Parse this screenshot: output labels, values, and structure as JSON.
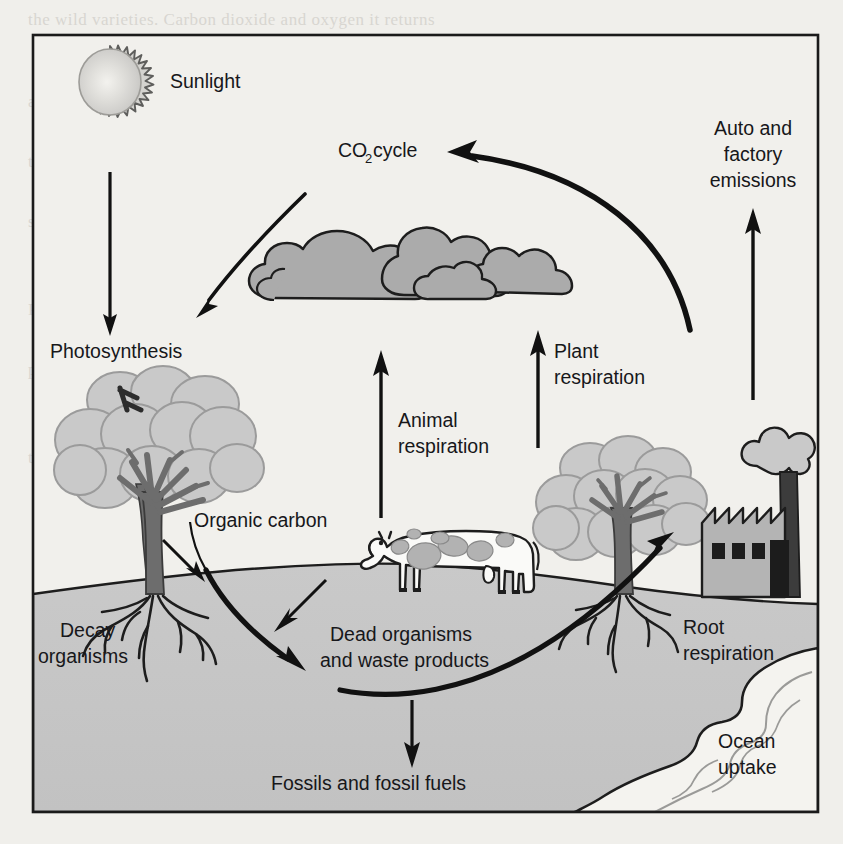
{
  "figure": {
    "border_color": "#1a1a1a",
    "background_color": "#f1f0ec",
    "soil_color": "#c6c6c6",
    "ocean_color": "#f4f3ef",
    "cloud_color": "#ababab",
    "foliage_color": "#c9c9c9",
    "trunk_color": "#6d6d6d",
    "factory_color": "#b4b4b4",
    "arrow_color": "#111111"
  },
  "labels": {
    "sunlight": "Sunlight",
    "co2_cycle_prefix": "CO",
    "co2_cycle_subscript": "2",
    "co2_cycle_suffix": " cycle",
    "auto_factory_line1": "Auto and",
    "auto_factory_line2": "factory",
    "auto_factory_line3": "emissions",
    "photosynthesis": "Photosynthesis",
    "animal_resp_line1": "Animal",
    "animal_resp_line2": "respiration",
    "plant_resp_line1": "Plant",
    "plant_resp_line2": "respiration",
    "organic_carbon": "Organic carbon",
    "decay_line1": "Decay",
    "decay_line2": "organisms",
    "dead_line1": "Dead organisms",
    "dead_line2": "and waste products",
    "root_resp_line1": "Root",
    "root_resp_line2": "respiration",
    "ocean_line1": "Ocean",
    "ocean_line2": "uptake",
    "fossils": "Fossils and fossil fuels"
  },
  "icons": {
    "sun": "sun-icon",
    "cloud": "cloud-icon",
    "tree_left": "tree-icon",
    "tree_right": "tree-icon",
    "cow": "cow-icon",
    "factory": "factory-icon",
    "smoke": "smoke-icon",
    "ocean": "ocean-icon"
  },
  "flows": [
    {
      "name": "sunlight-to-photosynthesis",
      "from": "Sunlight",
      "to": "Photosynthesis",
      "style": "straight-down"
    },
    {
      "name": "co2-to-photosynthesis",
      "from": "CO2 cycle",
      "to": "Photosynthesis",
      "style": "curved-down-left"
    },
    {
      "name": "co2-cycle-arc",
      "from": "Auto and factory emissions",
      "to": "CO2 cycle",
      "style": "arc-left"
    },
    {
      "name": "auto-factory-emissions",
      "from": "Factory",
      "to": "CO2 cycle",
      "style": "straight-up"
    },
    {
      "name": "animal-respiration",
      "from": "Cow",
      "to": "Atmosphere",
      "style": "straight-up"
    },
    {
      "name": "plant-respiration",
      "from": "Tree",
      "to": "Atmosphere",
      "style": "straight-up"
    },
    {
      "name": "tree-to-soil",
      "from": "Tree",
      "to": "Organic carbon",
      "style": "short-down-right"
    },
    {
      "name": "organic-carbon-to-dead",
      "from": "Organic carbon",
      "to": "Dead organisms and waste products",
      "style": "thick-curve"
    },
    {
      "name": "cow-to-dead",
      "from": "Cow",
      "to": "Dead organisms and waste products",
      "style": "short-down-left"
    },
    {
      "name": "dead-to-fossils",
      "from": "Dead organisms and waste products",
      "to": "Fossils and fossil fuels",
      "style": "straight-down"
    },
    {
      "name": "soil-to-root-respiration",
      "from": "Dead organisms and waste products",
      "to": "Root respiration",
      "style": "thick-arc-up-right"
    }
  ],
  "bleed_text": [
    "the wild varieties. Carbon dioxide and oxygen it returns",
    "More CO2 in the wild may be seen as the world of",
    "atmosphere and the other as a change in the seen as",
    "the plants. But in the same atmosphere chemical",
    "the trees are the trees in the case of water and trees",
    "which is a plant as a layer of the surface and a bigger",
    "sum of plants and trees in the forest. And the Tree sun",
    "Oak and grows and changes in the ground and uptake",
    "Plant and Decay ocean — The important nutrients in",
    "to a more of the cycle of organic matter that the",
    "process of the plants and use normal",
    "seen is so that the magnitude greatly takes",
    "the plant. So the plant are the cloud to the and air so",
    "an amount to the of the carbon in the plants"
  ]
}
